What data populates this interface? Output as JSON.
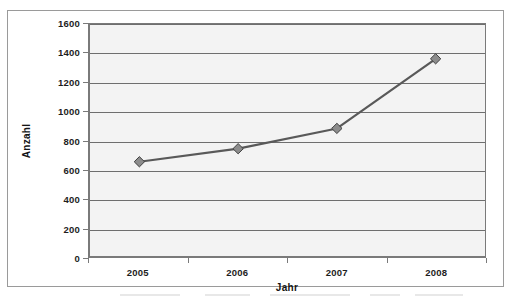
{
  "chart_data": {
    "type": "line",
    "title": "",
    "subtitle": "",
    "xlabel": "Jahr",
    "ylabel": "Anzahl",
    "categories": [
      "2005",
      "2006",
      "2007",
      "2008"
    ],
    "values": [
      650,
      740,
      880,
      1360
    ],
    "series": [
      {
        "name": "Anzahl",
        "values": [
          650,
          740,
          880,
          1360
        ]
      }
    ],
    "ylim": [
      0,
      1600
    ],
    "y_ticks": [
      0,
      200,
      400,
      600,
      800,
      1000,
      1200,
      1400,
      1600
    ],
    "y_tick_labels": [
      "0",
      "200",
      "400",
      "600",
      "800",
      "1000",
      "1200",
      "1400",
      "1600"
    ],
    "x_tick_labels": [
      "2005",
      "2006",
      "2007",
      "2008"
    ],
    "grid": "horizontal",
    "legend": "none",
    "annotations": [],
    "marker": "diamond",
    "colors": {
      "line": "#595959",
      "marker_fill": "#8c8c8c",
      "marker_border": "#3f3f3f",
      "gridline": "#6e6e6e",
      "axis": "#7a7a7a",
      "plot_background": "#f3f3f3",
      "chart_background": "#ffffff",
      "chart_border": "#9a9a9a",
      "text": "#1d1d1d"
    }
  }
}
